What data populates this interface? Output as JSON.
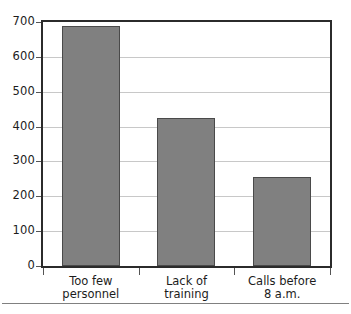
{
  "chart_data": {
    "type": "bar",
    "title": "",
    "subtitle": "",
    "xlabel": "",
    "ylabel": "",
    "categories": [
      "Too few personnel",
      "Lack of training",
      "Calls before 8 a.m."
    ],
    "category_lines": [
      [
        "Too few",
        "personnel"
      ],
      [
        "Lack of",
        "training"
      ],
      [
        "Calls before",
        "8 a.m."
      ]
    ],
    "values": [
      690,
      425,
      255
    ],
    "ylim": [
      0,
      700
    ],
    "yticks": [
      0,
      100,
      200,
      300,
      400,
      500,
      600,
      700
    ],
    "ytick_labels": [
      "0",
      "100",
      "200",
      "300",
      "400",
      "500",
      "600",
      "700"
    ],
    "grid": true,
    "legend": "none",
    "orientation": "vertical",
    "colors": {
      "bar_fill": "#808080",
      "bar_edge": "#4a4a4a",
      "gridline": "#c8c8c8",
      "frame": "#2b2b2b",
      "text": "#1c1c1c",
      "footer_rule": "#808080",
      "background": "#ffffff"
    }
  }
}
